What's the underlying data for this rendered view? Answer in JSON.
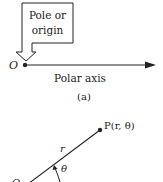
{
  "figure_a": {
    "callout_line1": "Pole or",
    "callout_line2": "origin",
    "pole_label": "O",
    "axis_label": "Polar axis",
    "caption": "(a)"
  },
  "figure_b": {
    "point_label": "P(r, θ)",
    "radius_label": "r",
    "angle_label": "θ"
  },
  "colors": {
    "ink": "#222222",
    "background": "#ffffff"
  }
}
